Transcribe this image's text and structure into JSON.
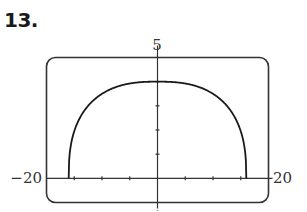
{
  "problem": {
    "number": "13."
  },
  "chart_data": {
    "type": "line",
    "title": "",
    "xlabel": "",
    "ylabel": "",
    "xlim": [
      -20,
      20
    ],
    "ylim": [
      -1,
      5
    ],
    "xscale": 5,
    "yscale": 1,
    "grid": false,
    "legend": null,
    "tick_labels": {
      "xmin": "−20",
      "xmax": "20",
      "ymax": "5"
    },
    "series": [
      {
        "name": "curve",
        "x": [
          -16,
          -15.9,
          -15.5,
          -15,
          -14,
          -12,
          -10,
          -8,
          -6,
          -4,
          -2,
          0,
          2,
          4,
          6,
          8,
          10,
          12,
          14,
          15,
          15.5,
          15.9,
          16
        ],
        "y": [
          0,
          1.2,
          2.1,
          2.6,
          3.0,
          3.45,
          3.7,
          3.85,
          3.93,
          3.97,
          3.99,
          4,
          3.99,
          3.97,
          3.93,
          3.85,
          3.7,
          3.45,
          3.0,
          2.6,
          2.1,
          1.2,
          0
        ]
      }
    ],
    "colors": {
      "curve": "#1a1a1a",
      "axes": "#333333",
      "frame": "#333333"
    }
  }
}
